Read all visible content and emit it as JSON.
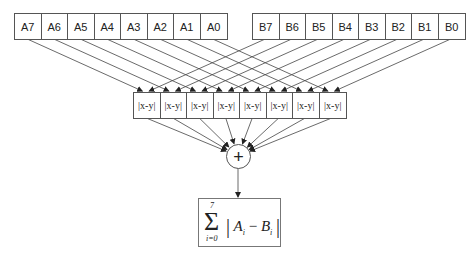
{
  "diagram": {
    "inputs_a": [
      "A7",
      "A6",
      "A5",
      "A4",
      "A3",
      "A2",
      "A1",
      "A0"
    ],
    "inputs_b": [
      "B7",
      "B6",
      "B5",
      "B4",
      "B3",
      "B2",
      "B1",
      "B0"
    ],
    "abs_diff_units": [
      "|x-y|",
      "|x-y|",
      "|x-y|",
      "|x-y|",
      "|x-y|",
      "|x-y|",
      "|x-y|",
      "|x-y|"
    ],
    "adder_symbol": "+",
    "output": {
      "sigma": "Σ",
      "upper_limit": "7",
      "lower_limit": "i=0",
      "bar_left": "|",
      "term_a": "A",
      "sub_a": "i",
      "minus": "−",
      "term_b": "B",
      "sub_b": "i",
      "bar_right": "|"
    },
    "colors": {
      "stroke": "#555555",
      "text": "#222222",
      "background": "#ffffff"
    }
  }
}
